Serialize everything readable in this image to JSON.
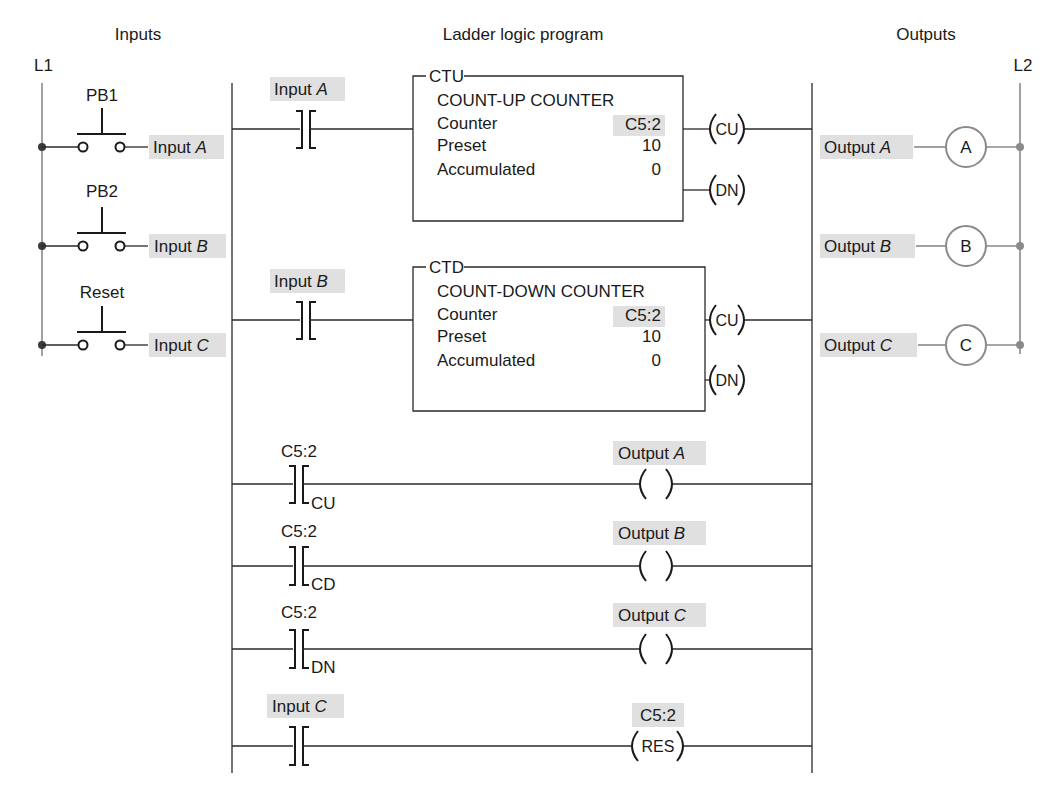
{
  "colors": {
    "wire": "#2a2a2a",
    "rail_gray": "#8a8a8a",
    "highlight": "#e0e0e0",
    "text": "#1a1a1a",
    "background": "#ffffff"
  },
  "headers": {
    "inputs": "Inputs",
    "program": "Ladder logic program",
    "outputs": "Outputs"
  },
  "rails": {
    "left": "L1",
    "right": "L2"
  },
  "inputs": [
    {
      "switch_label": "PB1",
      "signal": "Input",
      "letter": "A"
    },
    {
      "switch_label": "PB2",
      "signal": "Input",
      "letter": "B"
    },
    {
      "switch_label": "Reset",
      "signal": "Input",
      "letter": "C"
    }
  ],
  "outputs": [
    {
      "signal": "Output",
      "letter": "A",
      "coil": "A"
    },
    {
      "signal": "Output",
      "letter": "B",
      "coil": "B"
    },
    {
      "signal": "Output",
      "letter": "C",
      "coil": "C"
    }
  ],
  "counters": [
    {
      "contact_signal": "Input",
      "contact_letter": "A",
      "type": "CTU",
      "title": "COUNT-UP COUNTER",
      "rows": [
        {
          "label": "Counter",
          "value": "C5:2"
        },
        {
          "label": "Preset",
          "value": "10"
        },
        {
          "label": "Accumulated",
          "value": "0"
        }
      ],
      "out_top": "CU",
      "out_bottom": "DN"
    },
    {
      "contact_signal": "Input",
      "contact_letter": "B",
      "type": "CTD",
      "title": "COUNT-DOWN COUNTER",
      "rows": [
        {
          "label": "Counter",
          "value": "C5:2"
        },
        {
          "label": "Preset",
          "value": "10"
        },
        {
          "label": "Accumulated",
          "value": "0"
        }
      ],
      "out_top": "CU",
      "out_bottom": "DN"
    }
  ],
  "rungs": [
    {
      "contact_tag": "C5:2",
      "contact_bit": "CU",
      "coil_signal": "Output",
      "coil_letter": "A"
    },
    {
      "contact_tag": "C5:2",
      "contact_bit": "CD",
      "coil_signal": "Output",
      "coil_letter": "B"
    },
    {
      "contact_tag": "C5:2",
      "contact_bit": "DN",
      "coil_signal": "Output",
      "coil_letter": "C"
    }
  ],
  "reset_rung": {
    "contact_signal": "Input",
    "contact_letter": "C",
    "coil_tag": "C5:2",
    "coil_label": "RES"
  }
}
